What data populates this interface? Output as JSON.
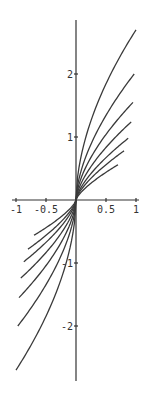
{
  "chart_data": {
    "type": "line",
    "title": "",
    "xlabel": "",
    "ylabel": "",
    "xlim": [
      -1,
      1
    ],
    "ylim": [
      -2.8,
      2.8
    ],
    "grid": false,
    "legend": "none",
    "x_ticks": [
      {
        "value": -1,
        "label": "-1"
      },
      {
        "value": -0.5,
        "label": "-0.5"
      },
      {
        "value": 0.5,
        "label": "0.5"
      },
      {
        "value": 1,
        "label": "1"
      }
    ],
    "y_ticks": [
      {
        "value": 2,
        "label": "2"
      },
      {
        "value": 1,
        "label": "1"
      },
      {
        "value": -1,
        "label": "-1"
      },
      {
        "value": -2,
        "label": "-2"
      }
    ],
    "series": [
      {
        "name": "curve-1",
        "x_end": 1.0,
        "y_end": 2.7,
        "exponent": 0.55
      },
      {
        "name": "curve-2",
        "x_end": 0.97,
        "y_end": 2.0,
        "exponent": 0.6
      },
      {
        "name": "curve-3",
        "x_end": 0.95,
        "y_end": 1.55,
        "exponent": 0.62
      },
      {
        "name": "curve-4",
        "x_end": 0.92,
        "y_end": 1.24,
        "exponent": 0.65
      },
      {
        "name": "curve-5",
        "x_end": 0.87,
        "y_end": 0.98,
        "exponent": 0.68
      },
      {
        "name": "curve-6",
        "x_end": 0.8,
        "y_end": 0.78,
        "exponent": 0.7
      },
      {
        "name": "curve-7",
        "x_end": 0.7,
        "y_end": 0.56,
        "exponent": 0.72
      }
    ],
    "symmetry": "odd (each curve spans -x_end..x_end, y(-x) = -y(x))"
  },
  "layout": {
    "origin_px": [
      76,
      200
    ],
    "x_scale_px": 60,
    "y_scale_px": 63,
    "x_axis_px": [
      12,
      139
    ],
    "y_axis_px": [
      20,
      381
    ]
  }
}
